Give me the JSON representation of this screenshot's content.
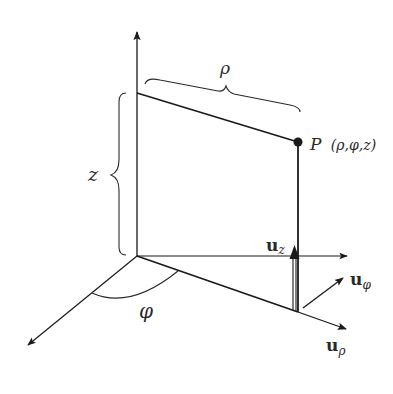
{
  "diagram": {
    "labels": {
      "rho": "ρ",
      "z": "z",
      "phi": "φ",
      "point": "P",
      "point_coords": "(ρ,φ,z)",
      "u_z_base": "u",
      "u_z_sub": "z",
      "u_phi_base": "u",
      "u_phi_sub": "φ",
      "u_rho_base": "u",
      "u_rho_sub": "ρ"
    },
    "colors": {
      "line": "#1a1a1a",
      "text": "#2a2a2a",
      "background": "#ffffff"
    }
  }
}
